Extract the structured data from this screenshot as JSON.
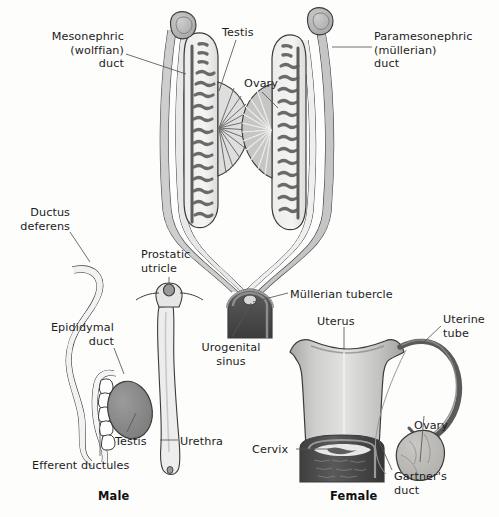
{
  "figure": {
    "background_color": "#fdfdfc",
    "width": 499,
    "height": 517
  },
  "palette": {
    "outline": "#3b3b3b",
    "duct_dark": "#6f6f6f",
    "duct_fill_light": "#d6d6d6",
    "duct_fill_mid": "#b5b5b5",
    "gonad_fill": "#f0f0ee",
    "gonad_cord": "#6a6a6a",
    "testis_fill": "#8a8a8a",
    "ovary_fill": "#b9b8b4",
    "sinus_dark": "#4a4a4a",
    "uterus_light": "#dddddb",
    "uterus_mid": "#b0b0ae",
    "vagina_dark": "#4f4f4f",
    "label_text": "#1c1c1c",
    "leader_line": "#555555"
  },
  "top_panel": {
    "name": "indifferent-stage-duct-system",
    "labels": [
      {
        "id": "mesonephric-duct",
        "text": "Mesonephric\n(wolffian)\nduct",
        "align": "right",
        "x": 8,
        "y": 30,
        "width": 116
      },
      {
        "id": "testis",
        "text": "Testis",
        "align": "left",
        "x": 222,
        "y": 26,
        "width": 60
      },
      {
        "id": "paramesonephric-duct",
        "text": "Paramesonephric\n(müllerian)\nduct",
        "align": "left",
        "x": 374,
        "y": 30,
        "width": 120
      },
      {
        "id": "ovary",
        "text": "Ovary",
        "align": "left",
        "x": 244,
        "y": 77,
        "width": 50
      },
      {
        "id": "mullerian-tubercle",
        "text": "Müllerian tubercle",
        "align": "left",
        "x": 290,
        "y": 288,
        "width": 120
      },
      {
        "id": "urogenital-sinus",
        "text": "Urogenital\nsinus",
        "align": "center",
        "x": 188,
        "y": 341,
        "width": 86
      }
    ]
  },
  "male_panel": {
    "name": "male-derivatives",
    "caption": "Male",
    "caption_x": 98,
    "caption_y": 489,
    "labels": [
      {
        "id": "ductus-deferens",
        "text": "Ductus\ndeferens",
        "align": "right",
        "x": 4,
        "y": 206,
        "width": 66
      },
      {
        "id": "prostatic-utricle",
        "text": "Prostatic\nutricle",
        "align": "left",
        "x": 141,
        "y": 248,
        "width": 68
      },
      {
        "id": "epididymal-duct",
        "text": "Epididymal\nduct",
        "align": "right",
        "x": 28,
        "y": 321,
        "width": 86
      },
      {
        "id": "testis-male",
        "text": "Testis",
        "align": "left",
        "x": 115,
        "y": 435,
        "width": 48
      },
      {
        "id": "urethra",
        "text": "Urethra",
        "align": "left",
        "x": 180,
        "y": 435,
        "width": 56
      },
      {
        "id": "efferent-ductules",
        "text": "Efferent ductules",
        "align": "left",
        "x": 32,
        "y": 459,
        "width": 114
      }
    ]
  },
  "female_panel": {
    "name": "female-derivatives",
    "caption": "Female",
    "caption_x": 330,
    "caption_y": 489,
    "labels": [
      {
        "id": "uterus",
        "text": "Uterus",
        "align": "left",
        "x": 317,
        "y": 315,
        "width": 54
      },
      {
        "id": "uterine-tube",
        "text": "Uterine\ntube",
        "align": "left",
        "x": 443,
        "y": 313,
        "width": 56
      },
      {
        "id": "cervix",
        "text": "Cervix",
        "align": "left",
        "x": 252,
        "y": 443,
        "width": 50
      },
      {
        "id": "ovary-female",
        "text": "Ovary",
        "align": "left",
        "x": 414,
        "y": 419,
        "width": 50
      },
      {
        "id": "gartners-duct",
        "text": "Gartner's\nduct",
        "align": "left",
        "x": 394,
        "y": 470,
        "width": 66
      }
    ]
  },
  "structures": {
    "top": [
      "mesonephros-remnant-left",
      "mesonephros-remnant-right",
      "gonad-testis",
      "gonad-ovary",
      "mesonephric-duct-left",
      "mesonephric-duct-right",
      "paramesonephric-duct-left",
      "paramesonephric-duct-right",
      "urogenital-sinus-block",
      "mullerian-tubercle-node"
    ],
    "male": [
      "ductus-deferens-loop",
      "epididymal-duct-coil",
      "efferent-ductules",
      "testis-oval",
      "prostatic-utricle-node",
      "urethra-tube"
    ],
    "female": [
      "uterus-body",
      "cervix-vagina-block",
      "uterine-tube-curve",
      "fimbriae",
      "ovary-oval",
      "gartners-duct-line"
    ]
  }
}
